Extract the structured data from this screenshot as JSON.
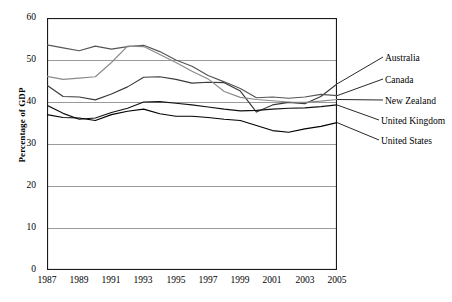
{
  "chart_data": {
    "type": "line",
    "title": "",
    "xlabel": "",
    "ylabel": "Percentage of GDP",
    "xlim": [
      1987,
      2005
    ],
    "ylim": [
      0,
      60
    ],
    "yticks": [
      0,
      10,
      20,
      30,
      40,
      50,
      60
    ],
    "xticks": [
      1987,
      1989,
      1991,
      1993,
      1995,
      1997,
      1999,
      2001,
      2003,
      2005
    ],
    "grid": "horizontal",
    "legend_position": "right-inline-labels",
    "x": [
      1987,
      1988,
      1989,
      1990,
      1991,
      1992,
      1993,
      1994,
      1995,
      1996,
      1997,
      1998,
      1999,
      2000,
      2001,
      2002,
      2003,
      2004,
      2005
    ],
    "series": [
      {
        "name": "Australia",
        "color": "#3a3a3a",
        "values": [
          44.0,
          41.3,
          41.2,
          40.5,
          41.9,
          43.6,
          45.9,
          46.0,
          45.4,
          44.5,
          44.7,
          44.6,
          42.6,
          37.6,
          39.3,
          39.9,
          39.6,
          41.3,
          44.3
        ]
      },
      {
        "name": "Canada",
        "color": "#555555",
        "values": [
          53.6,
          52.9,
          52.2,
          53.3,
          52.6,
          53.2,
          53.5,
          52.0,
          50.0,
          48.5,
          46.3,
          44.8,
          43.2,
          41.0,
          41.2,
          40.9,
          41.2,
          41.8,
          41.5
        ]
      },
      {
        "name": "New Zealand",
        "color": "#8a8a8a",
        "values": [
          46.1,
          45.4,
          45.7,
          46.0,
          49.4,
          53.3,
          53.2,
          51.3,
          49.4,
          47.3,
          45.5,
          42.5,
          41.1,
          40.6,
          40.3,
          40.0,
          39.9,
          40.2,
          40.6
        ]
      },
      {
        "name": "United Kingdom",
        "color": "#111111",
        "values": [
          39.2,
          37.3,
          35.9,
          36.2,
          37.5,
          38.5,
          40.0,
          40.1,
          39.7,
          39.3,
          38.8,
          38.3,
          37.9,
          38.0,
          38.3,
          38.5,
          38.6,
          38.9,
          39.3
        ]
      },
      {
        "name": "United States",
        "color": "#000000",
        "values": [
          37.0,
          36.3,
          36.2,
          35.6,
          37.0,
          37.8,
          38.3,
          37.2,
          36.6,
          36.6,
          36.3,
          35.9,
          35.6,
          34.4,
          33.2,
          32.8,
          33.6,
          34.2,
          35.1
        ]
      }
    ]
  },
  "axis": {
    "y_tick_labels": [
      "60",
      "50",
      "40",
      "30",
      "20",
      "10",
      "0"
    ],
    "x_tick_labels": [
      "1987",
      "1989",
      "1991",
      "1993",
      "1995",
      "1997",
      "1999",
      "2001",
      "2003",
      "2005"
    ],
    "y_title": "Percentage of GDP"
  },
  "series_labels": [
    {
      "name": "Australia",
      "text": "Australia"
    },
    {
      "name": "Canada",
      "text": "Canada"
    },
    {
      "name": "New Zealand",
      "text": "New Zealand"
    },
    {
      "name": "United Kingdom",
      "text": "United Kingdom"
    },
    {
      "name": "United States",
      "text": "United States"
    }
  ],
  "style": {
    "gridline_color": "#9a9a9a",
    "frame_color": "#1a1a1a",
    "background": "#ffffff"
  }
}
